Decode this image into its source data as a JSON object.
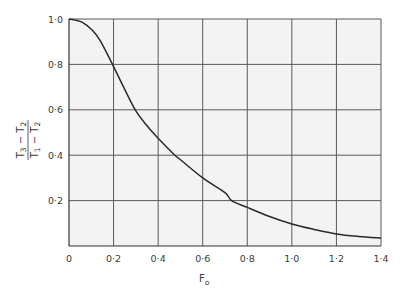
{
  "chart_data": {
    "type": "line",
    "title": "",
    "xlabel": "F",
    "xlabel_subscript": "o",
    "ylabel": {
      "numerator": {
        "base": "T",
        "sub1": "3",
        "mid": " − T",
        "sub2": "2"
      },
      "denominator": {
        "base": "T",
        "sub1": "1",
        "mid": " − T",
        "sub2": "2"
      },
      "plain": "(T3 − T2)/(T1 − T2)"
    },
    "xlim": [
      0,
      1.4
    ],
    "ylim": [
      0,
      1.0
    ],
    "grid": true,
    "x_ticks": [
      0,
      0.2,
      0.4,
      0.6,
      0.8,
      1.0,
      1.2,
      1.4
    ],
    "x_tick_labels": [
      "0",
      "0·2",
      "0·4",
      "0·6",
      "0·8",
      "1·0",
      "1·2",
      "1·4"
    ],
    "y_ticks": [
      0.2,
      0.4,
      0.6,
      0.8,
      1.0
    ],
    "y_tick_labels": [
      "0·2",
      "0·4",
      "0·6",
      "0·8",
      "1·0"
    ],
    "series": [
      {
        "name": "temperature ratio",
        "x": [
          0,
          0.03,
          0.06,
          0.1,
          0.14,
          0.2,
          0.25,
          0.3,
          0.35,
          0.4,
          0.475,
          0.5,
          0.6,
          0.7,
          0.73,
          0.8,
          0.9,
          1.0,
          1.1,
          1.2,
          1.3,
          1.4
        ],
        "y": [
          1.0,
          0.995,
          0.985,
          0.955,
          0.905,
          0.79,
          0.69,
          0.595,
          0.53,
          0.475,
          0.4,
          0.38,
          0.3,
          0.235,
          0.2,
          0.17,
          0.13,
          0.097,
          0.073,
          0.053,
          0.042,
          0.035
        ]
      }
    ]
  },
  "colors": {
    "curve": "#2a2a2a",
    "grid": "#5a5a5a",
    "plot_background": "#f3f3f3",
    "text": "#3a3a3a"
  }
}
